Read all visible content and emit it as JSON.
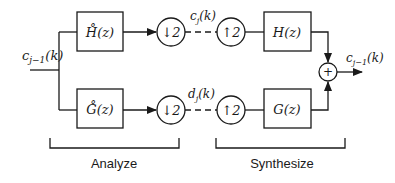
{
  "diagram": {
    "type": "two-channel filter bank",
    "input_label": "c_{j-1}(k)",
    "output_label": "c_{j-1}(k)",
    "blocks": {
      "analysis_high": "H̊(z)",
      "analysis_low": "G̊(z)",
      "synthesis_high": "H(z)",
      "synthesis_low": "G(z)"
    },
    "downsample": "↓2",
    "upsample": "↑2",
    "sum": "+",
    "signals": {
      "top": "c_j(k)",
      "bottom": "d_j(k)"
    },
    "sections": {
      "analyze": "Analyze",
      "synthesize": "Synthesize"
    }
  }
}
